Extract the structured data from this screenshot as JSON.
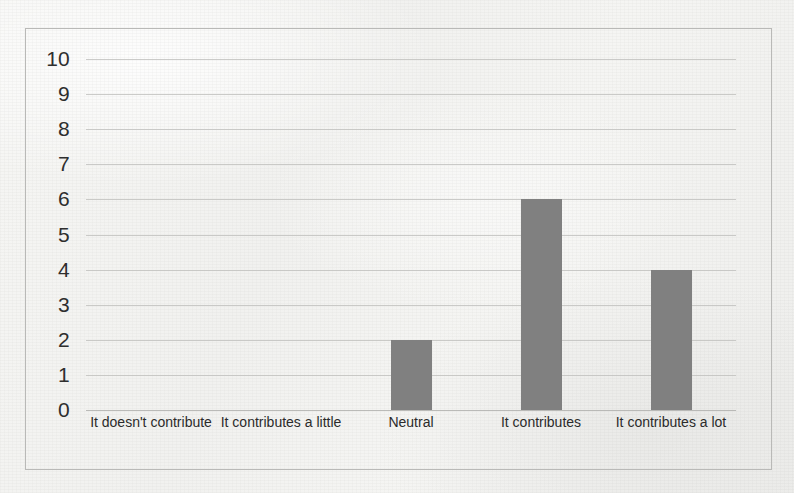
{
  "chart_data": {
    "type": "bar",
    "title": "",
    "xlabel": "",
    "ylabel": "",
    "categories": [
      "It doesn't contribute",
      "It contributes a little",
      "Neutral",
      "It contributes",
      "It contributes a lot"
    ],
    "values": [
      0,
      0,
      2,
      6,
      4
    ],
    "ylim": [
      0,
      10
    ],
    "ytick_labels": [
      "10",
      "9",
      "8",
      "7",
      "6",
      "5",
      "4",
      "3",
      "2",
      "1",
      "0"
    ],
    "ytick_values": [
      10,
      9,
      8,
      7,
      6,
      5,
      4,
      3,
      2,
      1,
      0
    ],
    "grid": true,
    "grid_axis": "y",
    "legend": false,
    "legend_position": "none",
    "bar_color": "#808080",
    "grid_color": "#c2c2c0",
    "text_color": "#2e2e2e",
    "background_color": "#f4f4f2",
    "border_color": "#b9b9b7"
  }
}
